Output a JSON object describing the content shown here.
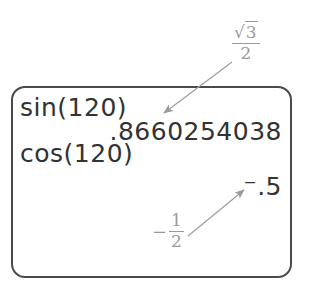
{
  "calculator_screen": {
    "lines": [
      {
        "text": "sin(120)",
        "align": "left"
      },
      {
        "text": ".8660254038",
        "align": "right"
      },
      {
        "text": "cos(120)",
        "align": "left"
      },
      {
        "text": "⁻.5",
        "align": "right"
      }
    ]
  },
  "annotations": {
    "sin_result": {
      "label": "√3/2",
      "numerator_symbol": "√",
      "numerator_value": "3",
      "denominator": "2"
    },
    "cos_result": {
      "label": "-1/2",
      "sign": "−",
      "numerator": "1",
      "denominator": "2"
    }
  },
  "colors": {
    "screen_text": "#333333",
    "annotation": "#9a9a9a",
    "border": "#4a4a4a"
  }
}
